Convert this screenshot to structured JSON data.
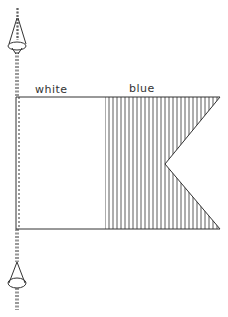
{
  "diagram": {
    "labels": {
      "hoist_half": "white",
      "fly_half": "blue"
    },
    "colors": {
      "line": "#333333",
      "background": "#ffffff"
    }
  }
}
